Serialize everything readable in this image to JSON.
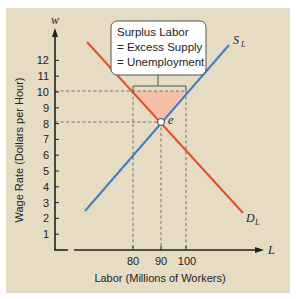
{
  "chart_data": {
    "type": "line",
    "title": "",
    "xlabel": "Labor (Millions of Workers)",
    "ylabel": "Wage Rate (Dollars per Hour)",
    "x_axis_symbol": "L",
    "y_axis_symbol": "w",
    "x_ticks": [
      "80",
      "90",
      "100"
    ],
    "y_ticks": [
      "1",
      "2",
      "3",
      "4",
      "5",
      "6",
      "7",
      "8",
      "9",
      "10",
      "11",
      "12"
    ],
    "ylim": [
      0,
      13
    ],
    "grid": false,
    "series": [
      {
        "name": "S_L",
        "label": "S",
        "subscript": "L",
        "color": "#3f7fbf",
        "points": [
          [
            64,
            2.5
          ],
          [
            90,
            8
          ],
          [
            100,
            10
          ],
          [
            115,
            13
          ]
        ]
      },
      {
        "name": "D_L",
        "label": "D",
        "subscript": "L",
        "color": "#e0502a",
        "points": [
          [
            65,
            13
          ],
          [
            80,
            10
          ],
          [
            90,
            8
          ],
          [
            115,
            2.4
          ]
        ]
      }
    ],
    "equilibrium": {
      "label": "e",
      "x": 90,
      "y": 8
    },
    "reference_lines": [
      {
        "axis": "y",
        "value": 10
      },
      {
        "axis": "y",
        "value": 8
      },
      {
        "axis": "x",
        "value": 80
      },
      {
        "axis": "x",
        "value": 90
      },
      {
        "axis": "x",
        "value": 100
      }
    ],
    "shaded_region": {
      "name": "surplus",
      "color": "#f7b8a4",
      "vertices": [
        [
          80,
          10
        ],
        [
          100,
          10
        ],
        [
          90,
          8
        ]
      ]
    },
    "annotation": {
      "lines": [
        "Surplus Labor",
        "= Excess Supply",
        "= Unemployment"
      ]
    }
  },
  "colors": {
    "panel_bg": "#e6dcc4",
    "supply": "#3f7fbf",
    "demand": "#e0502a",
    "shade": "#f7b8a4"
  }
}
